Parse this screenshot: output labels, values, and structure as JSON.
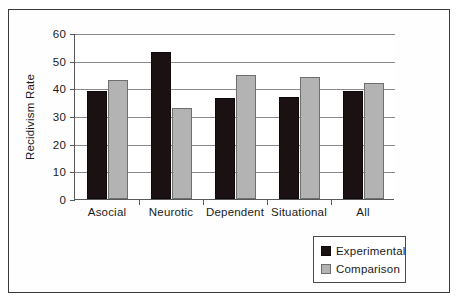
{
  "chart_data": {
    "type": "bar",
    "title": "",
    "xlabel": "",
    "ylabel": "Recidivism Rate",
    "ylim": [
      0,
      60
    ],
    "yticks": [
      0,
      10,
      20,
      30,
      40,
      50,
      60
    ],
    "ytick_labels": [
      "0",
      "10",
      "20",
      "30",
      "40",
      "50",
      "60"
    ],
    "grid": true,
    "legend_position": "bottom-right",
    "categories": [
      "Asocial",
      "Neurotic",
      "Dependent",
      "Situational",
      "All"
    ],
    "series": [
      {
        "name": "Experimental",
        "color": "#1b1113",
        "values": [
          39,
          53,
          36.5,
          37,
          39
        ]
      },
      {
        "name": "Comparison",
        "color": "#b3b3b3",
        "values": [
          43,
          33,
          45,
          44,
          42
        ]
      }
    ]
  },
  "legend": {
    "entries": [
      {
        "label": "Experimental",
        "swatch": "black-square-swatch"
      },
      {
        "label": "Comparison",
        "swatch": "gray-square-swatch"
      }
    ]
  }
}
